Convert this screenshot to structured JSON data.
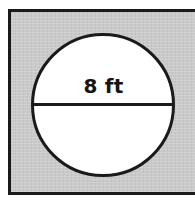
{
  "figure": {
    "kind": "geometry-diagram",
    "frame": {
      "fill_color": "#c9c9c9",
      "border_color": "#1a1a1a",
      "border_width_px": 3
    },
    "circle": {
      "fill_color": "#ffffff",
      "stroke_color": "#1a1a1a",
      "stroke_width_px": 3,
      "center_x_px": 103,
      "center_y_px": 105,
      "radius_px": 71
    },
    "diameter_line": {
      "color": "#1a1a1a",
      "thickness_px": 3
    },
    "dimension_label": {
      "text": "8 ft",
      "value": "8",
      "unit": "ft",
      "color": "#141414"
    }
  }
}
